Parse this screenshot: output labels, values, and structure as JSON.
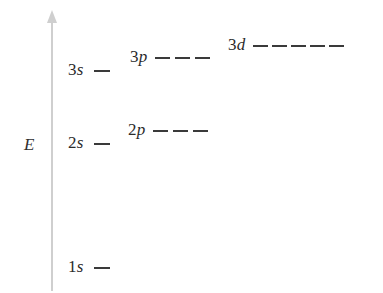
{
  "diagram": {
    "background_color": "#ffffff",
    "width": 383,
    "height": 293
  },
  "axis": {
    "caption": "E",
    "caption_meaning": "Energy",
    "color": "#cfcfcf",
    "direction": "up",
    "x": 51,
    "top_y": 10,
    "bottom_y": 291
  },
  "levels": [
    {
      "id": "1s",
      "principal": "1",
      "orbital": "s",
      "label": "1s",
      "degeneracy": 1,
      "y": 267,
      "label_x": 68,
      "dash_start_x": 100,
      "dash_width": 16,
      "dash_gap": 8,
      "color": "#3a3a3a"
    },
    {
      "id": "2s",
      "principal": "2",
      "orbital": "s",
      "label": "2s",
      "degeneracy": 1,
      "y": 143,
      "label_x": 68,
      "dash_start_x": 100,
      "dash_width": 16,
      "dash_gap": 8,
      "color": "#3a3a3a"
    },
    {
      "id": "2p",
      "principal": "2",
      "orbital": "p",
      "label": "2p",
      "degeneracy": 3,
      "y": 130,
      "label_x": 128,
      "dash_start_x": 158,
      "dash_width": 15,
      "dash_gap": 5,
      "color": "#3a3a3a"
    },
    {
      "id": "3s",
      "principal": "3",
      "orbital": "s",
      "label": "3s",
      "degeneracy": 1,
      "y": 70,
      "label_x": 68,
      "dash_start_x": 100,
      "dash_width": 16,
      "dash_gap": 8,
      "color": "#3a3a3a"
    },
    {
      "id": "3p",
      "principal": "3",
      "orbital": "p",
      "label": "3p",
      "degeneracy": 3,
      "y": 57,
      "label_x": 130,
      "dash_start_x": 160,
      "dash_width": 15,
      "dash_gap": 5,
      "color": "#3a3a3a"
    },
    {
      "id": "3d",
      "principal": "3",
      "orbital": "d",
      "label": "3d",
      "degeneracy": 5,
      "y": 45,
      "label_x": 228,
      "dash_start_x": 258,
      "dash_width": 15,
      "dash_gap": 4,
      "color": "#3a3a3a"
    }
  ]
}
